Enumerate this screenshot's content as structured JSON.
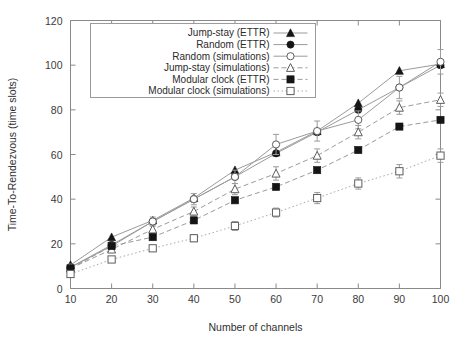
{
  "chart_data": {
    "type": "line",
    "title": "",
    "xlabel": "Number of channels",
    "ylabel": "Time-To-Rendezvous (time slots)",
    "xlim": [
      10,
      100
    ],
    "ylim": [
      0,
      120
    ],
    "xticks": [
      10,
      20,
      30,
      40,
      50,
      60,
      70,
      80,
      90,
      100
    ],
    "yticks": [
      0,
      20,
      40,
      60,
      80,
      100,
      120
    ],
    "grid": false,
    "legend_position": "top-center-inside",
    "x": [
      10,
      20,
      30,
      40,
      50,
      60,
      70,
      80,
      90,
      100
    ],
    "series": [
      {
        "name": "Jump-stay (ETTR)",
        "marker": "filled-triangle",
        "line": "solid",
        "values": [
          10.5,
          23.0,
          30.5,
          40.5,
          53.0,
          61.0,
          70.5,
          83.0,
          97.5,
          100.5
        ],
        "errors": [
          0,
          0,
          0,
          0,
          0,
          0,
          0,
          0,
          0,
          0
        ]
      },
      {
        "name": "Random (ETTR)",
        "marker": "filled-circle",
        "line": "solid",
        "values": [
          9.5,
          19.5,
          30.0,
          40.0,
          50.0,
          60.5,
          70.0,
          80.0,
          90.0,
          100.0
        ],
        "errors": [
          0,
          0,
          0,
          0,
          0,
          0,
          0,
          0,
          0,
          0
        ]
      },
      {
        "name": "Random (simulations)",
        "marker": "open-circle",
        "line": "solid",
        "values": [
          9.5,
          19.0,
          30.0,
          40.0,
          50.0,
          64.5,
          70.5,
          75.5,
          90.0,
          101.5
        ],
        "errors": [
          1.0,
          1.5,
          2.0,
          2.5,
          3.0,
          4.5,
          4.5,
          4.0,
          5.0,
          5.5
        ]
      },
      {
        "name": "Jump-stay (simulations)",
        "marker": "open-triangle",
        "line": "dashed",
        "values": [
          9.0,
          17.5,
          26.5,
          34.5,
          44.5,
          51.5,
          59.5,
          70.0,
          81.0,
          84.5
        ],
        "errors": [
          0.8,
          1.2,
          1.5,
          2.0,
          2.5,
          3.0,
          3.0,
          3.0,
          3.0,
          3.0
        ]
      },
      {
        "name": "Modular clock (ETTR)",
        "marker": "filled-square",
        "line": "dashed",
        "values": [
          9.0,
          19.0,
          23.0,
          30.5,
          39.5,
          45.5,
          53.0,
          62.0,
          72.5,
          75.5
        ],
        "errors": [
          0,
          0,
          0,
          0,
          0,
          0,
          0,
          0,
          0,
          0
        ]
      },
      {
        "name": "Modular clock (simulations)",
        "marker": "open-square",
        "line": "dotted",
        "values": [
          6.5,
          13.0,
          18.0,
          22.5,
          28.0,
          34.0,
          40.5,
          47.0,
          52.5,
          59.5
        ],
        "errors": [
          0.8,
          1.0,
          1.2,
          1.5,
          2.0,
          2.0,
          2.5,
          2.5,
          3.0,
          3.0
        ]
      }
    ]
  },
  "axes": {
    "x_tick_labels": [
      "10",
      "20",
      "30",
      "40",
      "50",
      "60",
      "70",
      "80",
      "90",
      "100"
    ],
    "y_tick_labels": [
      "0",
      "20",
      "40",
      "60",
      "80",
      "100",
      "120"
    ],
    "x_axis_title": "Number of channels",
    "y_axis_title": "Time-To-Rendezvous (time slots)"
  },
  "legend": {
    "entries": [
      "Jump-stay (ETTR)",
      "Random (ETTR)",
      "Random (simulations)",
      "Jump-stay (simulations)",
      "Modular clock (ETTR)",
      "Modular clock (simulations)"
    ]
  },
  "colors": {
    "marker_fill": "#151515",
    "marker_open_stroke": "#5d5d5d",
    "line": "#9b9b9b",
    "axis": "#8a8a8a",
    "text": "#2f2f2f",
    "background": "#ffffff"
  }
}
